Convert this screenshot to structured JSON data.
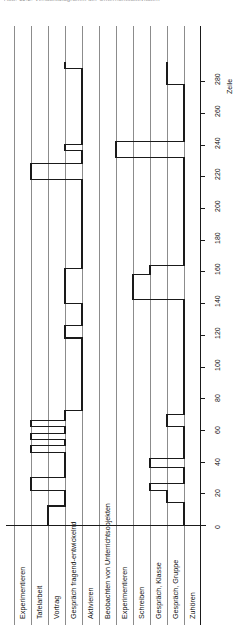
{
  "figure": {
    "clipped_header_text": "Abb. 11.2: Verlaufsdiagramm der Unterrichtsaktivitäten",
    "orientation": "rotated-90",
    "background": "#ffffff",
    "line_color": "#1a1a1a",
    "grid_color": "#8c8c8c"
  },
  "axis": {
    "title": "Zeile",
    "min": 0,
    "max": 290,
    "tick_step": 20,
    "ticks": [
      0,
      20,
      40,
      60,
      80,
      100,
      120,
      140,
      160,
      180,
      200,
      220,
      240,
      260,
      280
    ],
    "tick_labels": [
      "0",
      "20",
      "40",
      "60",
      "80",
      "100",
      "120",
      "140",
      "160",
      "180",
      "200",
      "220",
      "240",
      "260",
      "280"
    ]
  },
  "categories": [
    {
      "index": 0,
      "label": "Experimentieren"
    },
    {
      "index": 1,
      "label": "Tafelarbeit"
    },
    {
      "index": 2,
      "label": "Vortrag"
    },
    {
      "index": 3,
      "label": "Gespräch fragend-entwickelnd"
    },
    {
      "index": 4,
      "label": "Aktivieren"
    },
    {
      "index": 5,
      "label": "Beobachten von Unterrichtsobjekten"
    },
    {
      "index": 6,
      "label": "Experimentieren"
    },
    {
      "index": 7,
      "label": "Schreiben"
    },
    {
      "index": 8,
      "label": "Gespräch, Klasse"
    },
    {
      "index": 9,
      "label": "Gespräch, Gruppe"
    },
    {
      "index": 10,
      "label": "Zuhören"
    }
  ],
  "chart_data": {
    "type": "line",
    "title": "Verlaufsdiagramm der Unterrichtsaktivitäten",
    "xlabel": "Zeile",
    "ylabel": "",
    "xlim": [
      0,
      290
    ],
    "grid": true,
    "legend": null,
    "note": "Two step traces over line-number (Zeile). Each trace holds a category index and steps between categories. Category index 0 = Experimentieren ... 10 = Zuhören.",
    "series": [
      {
        "name": "Lehrer-Aktivität",
        "steps": [
          {
            "from": 0,
            "to": 12,
            "category": 2
          },
          {
            "from": 12,
            "to": 22,
            "category": 3
          },
          {
            "from": 22,
            "to": 30,
            "category": 1
          },
          {
            "from": 30,
            "to": 46,
            "category": 3
          },
          {
            "from": 46,
            "to": 50,
            "category": 1
          },
          {
            "from": 50,
            "to": 54,
            "category": 3
          },
          {
            "from": 54,
            "to": 58,
            "category": 1
          },
          {
            "from": 58,
            "to": 62,
            "category": 3
          },
          {
            "from": 62,
            "to": 66,
            "category": 1
          },
          {
            "from": 66,
            "to": 72,
            "category": 3
          },
          {
            "from": 72,
            "to": 118,
            "category": 4
          },
          {
            "from": 118,
            "to": 126,
            "category": 3
          },
          {
            "from": 126,
            "to": 140,
            "category": 4
          },
          {
            "from": 140,
            "to": 162,
            "category": 3
          },
          {
            "from": 162,
            "to": 218,
            "category": 4
          },
          {
            "from": 218,
            "to": 228,
            "category": 1
          },
          {
            "from": 228,
            "to": 236,
            "category": 4
          },
          {
            "from": 236,
            "to": 240,
            "category": 3
          },
          {
            "from": 240,
            "to": 288,
            "category": 4
          },
          {
            "from": 288,
            "to": 292,
            "category": 3
          }
        ]
      },
      {
        "name": "Schüler-Aktivität",
        "steps": [
          {
            "from": 0,
            "to": 14,
            "category": 10
          },
          {
            "from": 14,
            "to": 22,
            "category": 9
          },
          {
            "from": 22,
            "to": 26,
            "category": 8
          },
          {
            "from": 26,
            "to": 36,
            "category": 10
          },
          {
            "from": 36,
            "to": 42,
            "category": 8
          },
          {
            "from": 42,
            "to": 62,
            "category": 10
          },
          {
            "from": 62,
            "to": 70,
            "category": 9
          },
          {
            "from": 70,
            "to": 142,
            "category": 10
          },
          {
            "from": 142,
            "to": 158,
            "category": 7
          },
          {
            "from": 158,
            "to": 164,
            "category": 8
          },
          {
            "from": 164,
            "to": 232,
            "category": 10
          },
          {
            "from": 232,
            "to": 242,
            "category": 6
          },
          {
            "from": 242,
            "to": 278,
            "category": 10
          },
          {
            "from": 278,
            "to": 292,
            "category": 9
          }
        ]
      }
    ]
  }
}
